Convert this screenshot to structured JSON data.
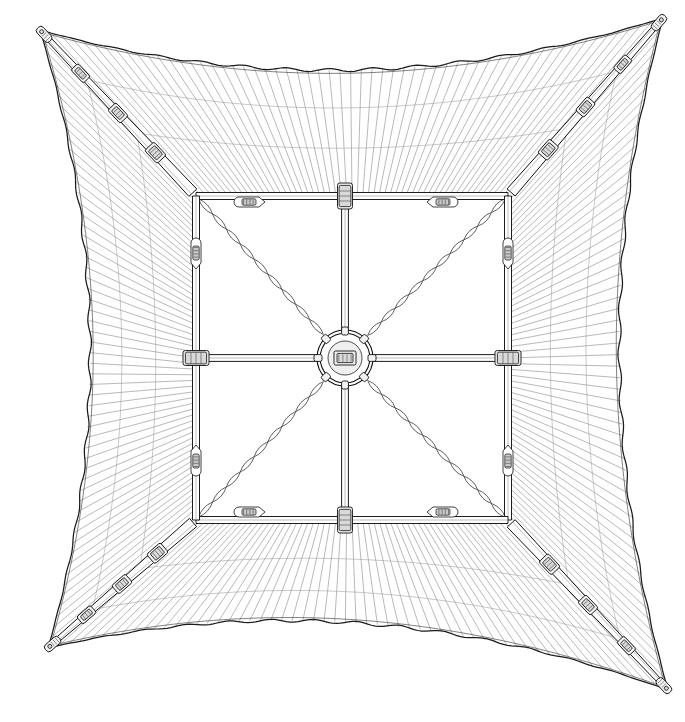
{
  "drawing": {
    "title": "Square Cantilever Parasol Canopy — Top Plan View",
    "subject": "umbrella-canopy-plan",
    "view": "top-down orthographic plan",
    "style": "monochrome technical line drawing",
    "background_color": "#ffffff",
    "line_color": "#111111",
    "seam_color": "#8d8d8d",
    "canvas": {
      "width": 685,
      "height": 722
    }
  },
  "geometry": {
    "center": {
      "x": 345,
      "y": 358
    },
    "canopy_corners": [
      {
        "name": "top-left",
        "x": 40,
        "y": 30
      },
      {
        "name": "top-right",
        "x": 663,
        "y": 18
      },
      {
        "name": "bottom-right",
        "x": 668,
        "y": 690
      },
      {
        "name": "bottom-left",
        "x": 48,
        "y": 648
      }
    ],
    "edge_sag": 46,
    "inner_frame": {
      "left": 196,
      "top": 196,
      "right": 508,
      "bottom": 520
    },
    "hub_outer_radius": 28,
    "hub_inner_radius": 17,
    "seam_count_per_edge": 58
  },
  "components": {
    "hub": {
      "label": "central-hub",
      "type": "double-ring crown hub",
      "spoke_count": 8,
      "note": "eight radial connections: 4 orthogonal ribs + 4 diagonal braided stays"
    },
    "diagonal_arms": {
      "label": "telescoping-diagonal-arm",
      "count": 4,
      "segments_per_arm": 4,
      "joint_collars_per_arm": 3,
      "tip_fitting": "end-cap",
      "note": "tapered telescoping tube running corner to inner frame corner"
    },
    "orthogonal_ribs": {
      "label": "orthogonal-rib",
      "count": 4,
      "orientation": [
        "north",
        "east",
        "south",
        "west"
      ],
      "note": "straight ribs from hub to inner frame mid-points"
    },
    "inner_frame": {
      "label": "inner-square-frame",
      "sides": 4,
      "note": "square rail frame carrying rib joints and clamp fittings"
    },
    "braided_stays": {
      "label": "braided-diagonal-stay",
      "count": 4,
      "pattern": "twisted rope / braid",
      "note": "runs hub to inner frame corners beneath the diagonal arms"
    },
    "rib_joint_collars": {
      "label": "rib-joint-collar",
      "count": 4,
      "note": "collars where orthogonal ribs cross the inner frame rails"
    },
    "clamp_fittings": {
      "label": "fabric-clamp-fitting",
      "count": 8,
      "note": "small oval tensioner clamps: 2 per inner frame side"
    },
    "canopy_fabric": {
      "label": "canopy-fabric-panel",
      "panels": 4,
      "seam_direction": "perpendicular to each outer edge",
      "edge_profile": "catenary / scalloped valance"
    }
  },
  "legend": {
    "items": [
      {
        "key": "hub",
        "label": "Central hub"
      },
      {
        "key": "arm",
        "label": "Telescoping diagonal arm"
      },
      {
        "key": "rib",
        "label": "Orthogonal rib"
      },
      {
        "key": "frame",
        "label": "Inner square frame"
      },
      {
        "key": "stay",
        "label": "Braided diagonal stay"
      },
      {
        "key": "clamp",
        "label": "Fabric clamp fitting"
      },
      {
        "key": "fabric",
        "label": "Canopy fabric panel"
      }
    ]
  }
}
